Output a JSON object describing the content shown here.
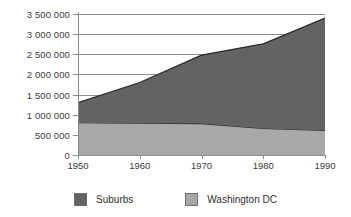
{
  "chart_data": {
    "type": "area",
    "title": "",
    "subtitle": "",
    "xlabel": "",
    "ylabel": "",
    "stacked": true,
    "grid": true,
    "legend_position": "bottom",
    "x": [
      1950,
      1960,
      1970,
      1980,
      1990
    ],
    "categories": [
      "1950",
      "1960",
      "1970",
      "1980",
      "1990"
    ],
    "xtick_labels": [
      "1950",
      "1960",
      "1970",
      "1980",
      "1990"
    ],
    "ytick_labels": [
      "0",
      "500 000",
      "1 000 000",
      "1 500 000",
      "2 000 000",
      "2 500 000",
      "3 000 000",
      "3 500 000"
    ],
    "ytick_values": [
      0,
      500000,
      1000000,
      1500000,
      2000000,
      2500000,
      3000000,
      3500000
    ],
    "ylim": [
      0,
      3500000
    ],
    "xlim": [
      1950,
      1990
    ],
    "series": [
      {
        "name": "Washington DC",
        "color": "#a8a8a8",
        "stack_order": 1,
        "values": [
          800000,
          790000,
          780000,
          660000,
          610000
        ]
      },
      {
        "name": "Suburbs",
        "color": "#636363",
        "stack_order": 2,
        "values": [
          500000,
          1010000,
          1700000,
          2100000,
          2790000
        ]
      }
    ],
    "cumulative_totals": [
      1300000,
      1800000,
      2480000,
      2760000,
      3400000
    ]
  },
  "legend": {
    "items": [
      {
        "label": "Suburbs",
        "color": "#636363"
      },
      {
        "label": "Washington DC",
        "color": "#a8a8a8"
      }
    ]
  },
  "colors": {
    "suburbs": "#636363",
    "washington_dc": "#a8a8a8",
    "axis": "#8c8c8c",
    "text": "#2f2f2f",
    "background": "#ffffff"
  }
}
